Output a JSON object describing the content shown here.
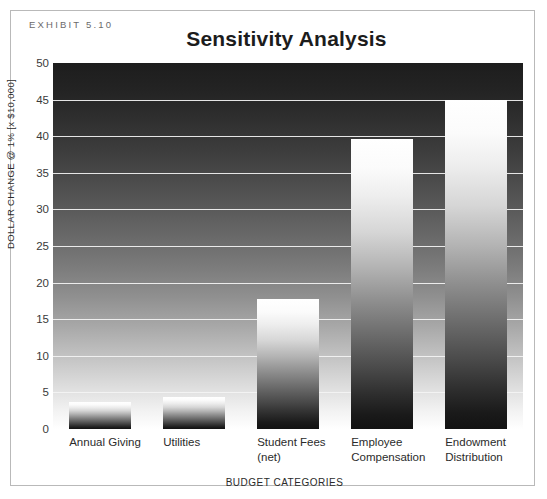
{
  "exhibit": {
    "label": "EXHIBIT 5.10"
  },
  "chart_data": {
    "type": "bar",
    "title": "Sensitivity Analysis",
    "xlabel": "BUDGET CATEGORIES",
    "ylabel": "DOLLAR CHANGE @ 1% [x $10,000]",
    "categories": [
      "Annual Giving",
      "Utilities",
      "Student Fees\n(net)",
      "Employee\nCompensation",
      "Endowment\nDistribution"
    ],
    "category_lines": [
      [
        "Annual Giving",
        ""
      ],
      [
        "Utilities",
        ""
      ],
      [
        "Student Fees",
        "(net)"
      ],
      [
        "Employee",
        "Compensation"
      ],
      [
        "Endowment",
        "Distribution"
      ]
    ],
    "values": [
      3.7,
      4.4,
      17.7,
      39.6,
      45.0
    ],
    "ylim": [
      0,
      50
    ],
    "yticks": [
      50,
      45,
      40,
      35,
      30,
      25,
      20,
      15,
      10,
      5,
      0
    ],
    "grid": true,
    "legend": "none"
  }
}
